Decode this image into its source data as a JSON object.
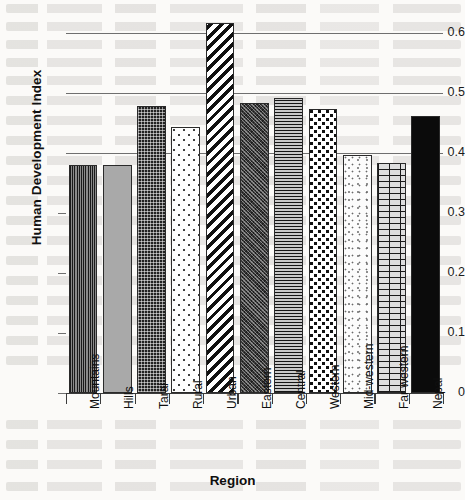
{
  "chart_data": {
    "type": "bar",
    "title": "",
    "xlabel": "Region",
    "ylabel": "Human Development Index",
    "categories": [
      "Mountains",
      "Hills",
      "Tarai",
      "Rural",
      "Urban",
      "Eastern",
      "Central",
      "Western",
      "Mid-western",
      "Far western",
      "Nepal"
    ],
    "values": [
      0.38,
      0.38,
      0.478,
      0.443,
      0.617,
      0.483,
      0.492,
      0.474,
      0.397,
      0.384,
      0.461
    ],
    "ylim": [
      0,
      0.65
    ],
    "y_ticks": [
      "0",
      "0.1",
      "0.2",
      "0.3",
      "0.4",
      "0.5",
      "0.6"
    ],
    "y_tick_values": [
      0,
      0.1,
      0.2,
      0.3,
      0.4,
      0.5,
      0.6
    ],
    "gridlines_at": [
      0.4,
      0.5,
      0.6
    ],
    "grid": true,
    "legend": "none",
    "bar_fills": [
      "vertical-lines",
      "solid-gray",
      "dark-dots",
      "light-dots",
      "diagonal-stripes",
      "dark-crosshatch",
      "horizontal-lines",
      "star-dots",
      "light-speckle",
      "brick",
      "solid-black"
    ]
  },
  "axes": {
    "y_title": "Human Development Index",
    "x_title": "Region"
  },
  "colors": {
    "axis": "#3b3b3b",
    "grid": "#6f6f6f",
    "text": "#101010",
    "page_background": "#fbfaf8"
  }
}
